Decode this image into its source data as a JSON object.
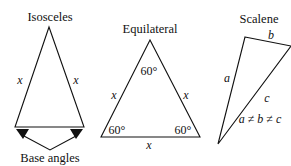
{
  "isosceles": {
    "title": "Isosceles",
    "left_side": "x",
    "right_side": "x",
    "caption": "Base angles"
  },
  "equilateral": {
    "title": "Equilateral",
    "top_angle": "60°",
    "left_angle": "60°",
    "right_angle": "60°",
    "left_side": "x",
    "right_side": "x",
    "bottom_side": "x"
  },
  "scalene": {
    "title": "Scalene",
    "side_a": "a",
    "side_b": "b",
    "side_c": "c",
    "inequality": "a ≠ b ≠ c"
  },
  "colors": {
    "stroke": "#111111",
    "background": "#ffffff"
  }
}
